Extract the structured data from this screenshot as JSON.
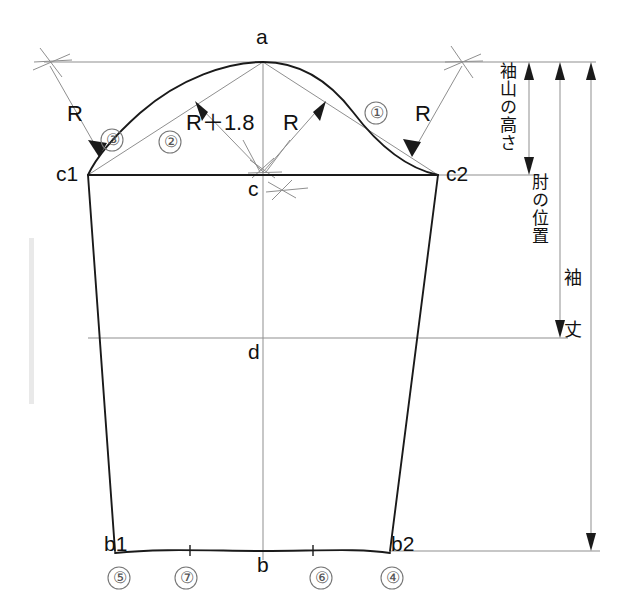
{
  "diagram": {
    "type": "sleeve-pattern-draft",
    "points": {
      "a": "a",
      "b": "b",
      "b1": "b1",
      "b2": "b2",
      "c": "c",
      "c1": "c1",
      "c2": "c2",
      "d": "d"
    },
    "radius_labels": {
      "r_top_left": "R",
      "r_top_right": "R",
      "r_center": "R",
      "r_plus": "R＋1.8"
    },
    "step_numbers": {
      "one": "①",
      "two": "②",
      "three": "③",
      "four": "④",
      "five": "⑤",
      "six": "⑥",
      "seven": "⑦"
    },
    "dimensions": {
      "cap_height": "袖山の高さ",
      "elbow_position": "肘の位置",
      "sleeve_length": "袖 丈"
    },
    "colors": {
      "outline": "#1a1a1a",
      "construction": "#8a8a8a",
      "text": "#111111",
      "circle_number": "#555555",
      "background": "#ffffff"
    }
  }
}
